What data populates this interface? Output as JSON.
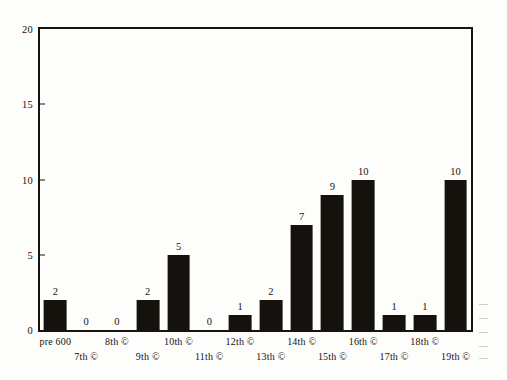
{
  "chart_data": {
    "type": "bar",
    "title": "",
    "subtitle": "",
    "xlabel": "",
    "ylabel": "",
    "categories": [
      "pre 600",
      "7th ©",
      "8th ©",
      "9th ©",
      "10th ©",
      "11th ©",
      "12th ©",
      "13th ©",
      "14th ©",
      "15th ©",
      "16th ©",
      "17th ©",
      "18th ©",
      "19th ©"
    ],
    "values": [
      2,
      0,
      0,
      2,
      5,
      0,
      1,
      2,
      7,
      9,
      10,
      1,
      1,
      10
    ],
    "value_labels": [
      "2",
      "0",
      "0",
      "2",
      "5",
      "0",
      "1",
      "2",
      "7",
      "9",
      "10",
      "1",
      "1",
      "10"
    ],
    "ylim": [
      0,
      20
    ],
    "yticks": [
      0,
      5,
      10,
      15,
      20
    ],
    "ytick_labels": [
      "0",
      "5",
      "10",
      "15",
      "20"
    ],
    "grid": false,
    "legend": false,
    "legend_position": "none",
    "bar_color": "#15120e",
    "axis_color": "#17140f",
    "text_color": "#16130f",
    "background_color": "#fdfdfb",
    "label_rows": [
      0,
      1,
      0,
      1,
      0,
      1,
      0,
      1,
      0,
      1,
      0,
      1,
      0,
      1
    ]
  }
}
